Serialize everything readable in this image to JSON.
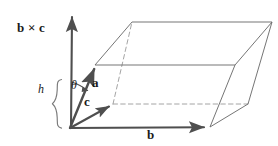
{
  "figure": {
    "width": 278,
    "height": 146,
    "background_color": "#ffffff",
    "line_color": "#6b6b6b",
    "solid_edge_color": "#707070",
    "hidden_edge_color": "#9a9a9a",
    "vector_color": "#4f4f4f",
    "text_color": "#1a1a1a"
  },
  "labels": {
    "normal": "b × c",
    "vector_a": "a",
    "vector_b": "b",
    "vector_c": "c",
    "height": "h",
    "angle": "θ"
  },
  "geometry": {
    "origin": {
      "x": 70,
      "y": 128
    },
    "vectors": [
      {
        "name": "b-cross-c",
        "from": [
          70,
          128
        ],
        "to": [
          72,
          14
        ],
        "style": "solid-arrow",
        "label": "b × c"
      },
      {
        "name": "a",
        "from": [
          70,
          128
        ],
        "to": [
          95,
          66
        ],
        "style": "solid-arrow",
        "label": "a"
      },
      {
        "name": "b",
        "from": [
          70,
          128
        ],
        "to": [
          209,
          127
        ],
        "style": "solid-arrow",
        "label": "b"
      },
      {
        "name": "c",
        "from": [
          70,
          128
        ],
        "to": [
          113,
          104
        ],
        "style": "solid-arrow",
        "label": "c"
      }
    ],
    "top_face": [
      [
        95,
        65
      ],
      [
        132,
        22
      ],
      [
        272,
        22
      ],
      [
        235,
        65
      ]
    ],
    "solid_edges": [
      [
        [
          95,
          65
        ],
        [
          132,
          22
        ]
      ],
      [
        [
          132,
          22
        ],
        [
          272,
          22
        ]
      ],
      [
        [
          272,
          22
        ],
        [
          235,
          65
        ]
      ],
      [
        [
          235,
          65
        ],
        [
          95,
          65
        ]
      ],
      [
        [
          272,
          22
        ],
        [
          248,
          104
        ]
      ],
      [
        [
          235,
          65
        ],
        [
          210,
          127
        ]
      ],
      [
        [
          248,
          104
        ],
        [
          210,
          127
        ]
      ],
      [
        [
          70,
          128
        ],
        [
          95,
          65
        ]
      ],
      [
        [
          70,
          128
        ],
        [
          209,
          127
        ]
      ]
    ],
    "hidden_edges": [
      [
        [
          113,
          104
        ],
        [
          248,
          104
        ]
      ],
      [
        [
          113,
          104
        ],
        [
          132,
          22
        ]
      ],
      [
        [
          70,
          128
        ],
        [
          113,
          104
        ]
      ]
    ],
    "height_brace": {
      "x": 56,
      "top": 79,
      "bottom": 129,
      "label": "h"
    },
    "angle_arc": {
      "center": [
        70,
        128
      ],
      "radius": 46,
      "from_deg": 268,
      "to_deg": 292,
      "label": "θ"
    }
  }
}
